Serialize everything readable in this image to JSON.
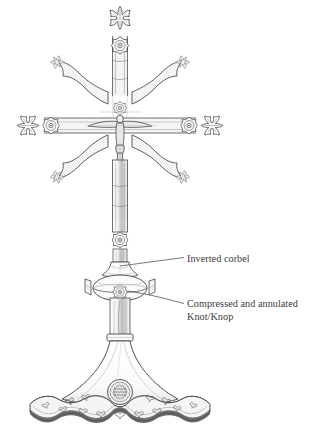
{
  "figure": {
    "background_color": "#ffffff",
    "ink_color": "#3a3a3a"
  },
  "annotations": [
    {
      "id": "inverted-corbel",
      "lines": [
        "Inverted corbel"
      ],
      "text": "Inverted corbel",
      "label_x": 187,
      "label_y": 252,
      "leader_from": {
        "x": 120,
        "y": 265
      },
      "leader_to": {
        "x": 184,
        "y": 257
      }
    },
    {
      "id": "compressed-annulated-knop",
      "lines": [
        "Compressed and annulated",
        "Knot/Knop"
      ],
      "line1": "Compressed and annulated",
      "line2": "Knot/Knop",
      "label_x": 187,
      "label_y": 297,
      "leader_from": {
        "x": 127,
        "y": 292
      },
      "leader_to": {
        "x": 184,
        "y": 303
      }
    }
  ],
  "parts": [
    {
      "name": "top-finial",
      "label": "fleur-de-lis finial"
    },
    {
      "name": "upper-rosette",
      "label": "quatrefoil rosette boss"
    },
    {
      "name": "left-arm-terminal",
      "label": "fleur-de-lis terminal"
    },
    {
      "name": "right-arm-terminal",
      "label": "fleur-de-lis terminal"
    },
    {
      "name": "corpus",
      "label": "crucified figure"
    },
    {
      "name": "shaft-rosette",
      "label": "shaft rosette boss"
    },
    {
      "name": "inverted-corbel",
      "label": "inverted corbel"
    },
    {
      "name": "knop",
      "label": "compressed and annulated knop"
    },
    {
      "name": "collar-ring",
      "label": "collar ring"
    },
    {
      "name": "base",
      "label": "lobed flaring foot"
    },
    {
      "name": "base-medallion",
      "label": "engraved medallion"
    }
  ]
}
